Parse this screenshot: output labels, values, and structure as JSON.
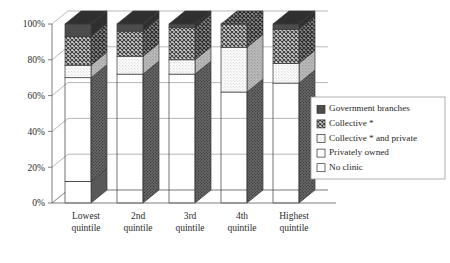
{
  "chart_data": {
    "type": "bar",
    "subtype": "stacked-column-100-percent-3d",
    "title": "",
    "xlabel": "",
    "ylabel": "",
    "ylim": [
      0,
      100
    ],
    "ytick_labels": [
      "0%",
      "20%",
      "40%",
      "60%",
      "80%",
      "100%"
    ],
    "ytick_values": [
      0,
      20,
      40,
      60,
      80,
      100
    ],
    "grid": true,
    "legend_position": "right-bottom",
    "stack_order_bottom_to_top": [
      "No clinic",
      "Privately owned",
      "Collective * and private",
      "Collective *",
      "Government branches"
    ],
    "categories": [
      "Lowest quintile",
      "2nd quintile",
      "3rd quintile",
      "4th quintile",
      "Highest quintile"
    ],
    "category_lines": [
      [
        "Lowest",
        "quintile"
      ],
      [
        "2nd",
        "quintile"
      ],
      [
        "3rd",
        "quintile"
      ],
      [
        "4th",
        "quintile"
      ],
      [
        "Highest",
        "quintile"
      ]
    ],
    "series": [
      {
        "name": "No clinic",
        "values": [
          12,
          0,
          0,
          0,
          0
        ]
      },
      {
        "name": "Privately owned",
        "values": [
          58,
          72,
          72,
          62,
          67
        ]
      },
      {
        "name": "Collective * and private",
        "values": [
          7,
          10,
          8,
          25,
          11
        ]
      },
      {
        "name": "Collective *",
        "values": [
          16,
          14,
          18,
          13,
          19
        ]
      },
      {
        "name": "Government branches",
        "values": [
          7,
          4,
          2,
          0,
          3
        ]
      }
    ],
    "cumulative_tops": {
      "Lowest quintile": {
        "No clinic": 12,
        "Privately owned": 70,
        "Collective * and private": 77,
        "Collective *": 93,
        "Government branches": 100
      },
      "2nd quintile": {
        "No clinic": 0,
        "Privately owned": 72,
        "Collective * and private": 82,
        "Collective *": 96,
        "Government branches": 100
      },
      "3rd quintile": {
        "No clinic": 0,
        "Privately owned": 72,
        "Collective * and private": 80,
        "Collective *": 98,
        "Government branches": 100
      },
      "4th quintile": {
        "No clinic": 0,
        "Privately owned": 62,
        "Collective * and private": 87,
        "Collective *": 100,
        "Government branches": 100
      },
      "Highest quintile": {
        "No clinic": 0,
        "Privately owned": 67,
        "Collective * and private": 78,
        "Collective *": 97,
        "Government branches": 100
      }
    }
  },
  "legend": {
    "items": [
      {
        "label": "Government branches",
        "pattern": "solid-dark",
        "color": "#4a4a4a"
      },
      {
        "label": "Collective *",
        "pattern": "cross-hatch",
        "color": "#6e6e6e"
      },
      {
        "label": "Collective * and private",
        "pattern": "fine-dots-light",
        "color": "#fbfbfb"
      },
      {
        "label": "Privately owned",
        "pattern": "dense-dots",
        "color": "#8d8d8d"
      },
      {
        "label": "No clinic",
        "pattern": "empty",
        "color": "#ffffff"
      }
    ]
  },
  "axis": {
    "y_labels": [
      "100%",
      "80%",
      "60%",
      "40%",
      "20%",
      "0%"
    ]
  }
}
